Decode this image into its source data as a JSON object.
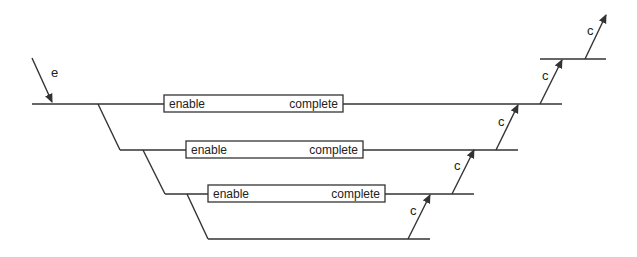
{
  "diagram": {
    "type": "staircase-pipeline",
    "stroke_color": "#333333",
    "background": "#ffffff",
    "entry_arrow": {
      "label": "e",
      "from": [
        32,
        58
      ],
      "to": [
        52,
        102
      ],
      "label_pos": [
        51,
        77
      ]
    },
    "levels": [
      {
        "line": {
          "y": 104,
          "x1": 32,
          "x2": 562
        },
        "box": {
          "x": 164,
          "y": 95,
          "w": 179,
          "h": 17,
          "left_label": "enable",
          "right_label": "complete"
        },
        "branch_to_next": {
          "from": [
            98,
            104
          ],
          "to": [
            120,
            150
          ]
        }
      },
      {
        "line": {
          "y": 150,
          "x1": 120,
          "x2": 518
        },
        "box": {
          "x": 186,
          "y": 141,
          "w": 177,
          "h": 17,
          "left_label": "enable",
          "right_label": "complete"
        },
        "branch_to_next": {
          "from": [
            143,
            150
          ],
          "to": [
            165,
            194
          ]
        }
      },
      {
        "line": {
          "y": 194,
          "x1": 165,
          "x2": 474
        },
        "box": {
          "x": 208,
          "y": 185,
          "w": 177,
          "h": 17,
          "left_label": "enable",
          "right_label": "complete"
        },
        "branch_to_next": {
          "from": [
            187,
            194
          ],
          "to": [
            208,
            239
          ]
        }
      },
      {
        "line": {
          "y": 239,
          "x1": 208,
          "x2": 430
        }
      }
    ],
    "top_line": {
      "y": 59,
      "x1": 540,
      "x2": 606
    },
    "completion_arrows": [
      {
        "label": "c",
        "from": [
          408,
          239
        ],
        "to": [
          430,
          195
        ],
        "label_pos": [
          408,
          215
        ]
      },
      {
        "label": "c",
        "from": [
          452,
          194
        ],
        "to": [
          474,
          150
        ],
        "label_pos": [
          452,
          170
        ]
      },
      {
        "label": "c",
        "from": [
          496,
          150
        ],
        "to": [
          518,
          105
        ],
        "label_pos": [
          496,
          126
        ]
      },
      {
        "label": "c",
        "from": [
          540,
          104
        ],
        "to": [
          562,
          60
        ],
        "label_pos": [
          540,
          80
        ]
      },
      {
        "label": "c",
        "from": [
          585,
          59
        ],
        "to": [
          606,
          15
        ],
        "label_pos": [
          585,
          35
        ]
      }
    ]
  }
}
